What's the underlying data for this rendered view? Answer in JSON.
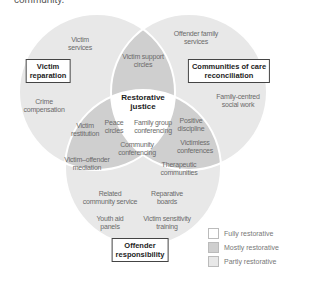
{
  "header": {
    "text": "community."
  },
  "colors": {
    "fully": "#ffffff",
    "mostly": "#cfcfcf",
    "partly": "#e8e8e8",
    "outline": "#ffffff"
  },
  "circles": {
    "victim": {
      "title": "Victim reparation",
      "title_line1": "Victim",
      "title_line2": "reparation",
      "items": [
        "Victim services",
        "Crime compensation"
      ]
    },
    "communities": {
      "title": "Communities of care reconciliation",
      "title_line1": "Communities of care",
      "title_line2": "reconciliation",
      "items": [
        "Offender family services",
        "Family-centred social work"
      ]
    },
    "offender": {
      "title": "Offender responsibility",
      "title_line1": "Offender",
      "title_line2": "responsibility",
      "items": [
        "Related community service",
        "Reparative boards",
        "Youth aid panels",
        "Victim sensitivity training"
      ]
    }
  },
  "overlaps": {
    "victim_communities": [
      "Victim support circles"
    ],
    "victim_offender": [
      "Victim restitution",
      "Victim–offender mediation"
    ],
    "communities_offender": [
      "Positive discipline",
      "Victimless conferences",
      "Therapeutic communities"
    ]
  },
  "center": {
    "title_line1": "Restorative",
    "title_line2": "justice",
    "items": [
      "Peace circles",
      "Family group conferencing",
      "Community conferencing"
    ]
  },
  "labels": {
    "victim_services_1": "Victim",
    "victim_services_2": "services",
    "crime_comp_1": "Crime",
    "crime_comp_2": "compensation",
    "offender_family_1": "Offender family",
    "offender_family_2": "services",
    "family_centred_1": "Family-centred",
    "family_centred_2": "social work",
    "victim_support_1": "Victim support",
    "victim_support_2": "circles",
    "victim_restitution_1": "Victim",
    "victim_restitution_2": "restitution",
    "vom_1": "Victim–offender",
    "vom_2": "mediation",
    "positive_1": "Positive",
    "positive_2": "discipline",
    "victimless_1": "Victimless",
    "victimless_2": "conferences",
    "therapeutic_1": "Therapeutic",
    "therapeutic_2": "communities",
    "peace_1": "Peace",
    "peace_2": "circles",
    "fgc_1": "Family group",
    "fgc_2": "conferencing",
    "cc_1": "Community",
    "cc_2": "conferencing",
    "rcs_1": "Related",
    "rcs_2": "community service",
    "rb_1": "Reparative",
    "rb_2": "boards",
    "yap_1": "Youth aid",
    "yap_2": "panels",
    "vst_1": "Victim sensitivity",
    "vst_2": "training"
  },
  "legend": {
    "items": [
      {
        "label": "Fully restorative",
        "color": "#ffffff"
      },
      {
        "label": "Mostly restorative",
        "color": "#cfcfcf"
      },
      {
        "label": "Partly restorative",
        "color": "#e8e8e8"
      }
    ]
  }
}
